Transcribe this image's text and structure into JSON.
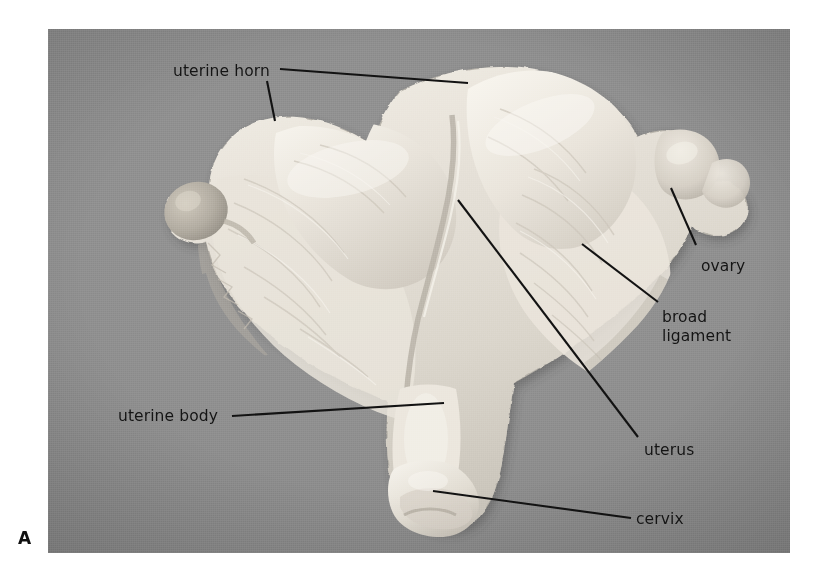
{
  "figure": {
    "panel_letter": "A",
    "background_color": "#8d8d8d",
    "label_color": "#141414",
    "leader_line_color": "#121212",
    "tissue_color": "#e3dfd6"
  },
  "annotations": [
    {
      "id": "uterine-horn",
      "label": "uterine horn",
      "text_x": 125,
      "text_y": 33,
      "leaders": [
        {
          "x1": 232,
          "y1": 40,
          "x2": 420,
          "y2": 54
        },
        {
          "x1": 219,
          "y1": 52,
          "x2": 227,
          "y2": 92
        }
      ]
    },
    {
      "id": "ovary",
      "label": "ovary",
      "text_x": 653,
      "text_y": 228,
      "leaders": [
        {
          "x1": 648,
          "y1": 216,
          "x2": 623,
          "y2": 159
        }
      ]
    },
    {
      "id": "broad-ligament",
      "label": "broad\nligament",
      "text_x": 614,
      "text_y": 279,
      "leaders": [
        {
          "x1": 610,
          "y1": 273,
          "x2": 534,
          "y2": 215
        }
      ]
    },
    {
      "id": "uterus",
      "label": "uterus",
      "text_x": 596,
      "text_y": 412,
      "leaders": [
        {
          "x1": 590,
          "y1": 408,
          "x2": 410,
          "y2": 171
        }
      ]
    },
    {
      "id": "uterine-body",
      "label": "uterine body",
      "text_x": 70,
      "text_y": 378,
      "leaders": [
        {
          "x1": 184,
          "y1": 387,
          "x2": 396,
          "y2": 374
        }
      ]
    },
    {
      "id": "cervix",
      "label": "cervix",
      "text_x": 588,
      "text_y": 481,
      "leaders": [
        {
          "x1": 583,
          "y1": 489,
          "x2": 385,
          "y2": 462
        }
      ]
    }
  ],
  "specimen": {
    "description": "bovine uterus, opened dorsal view",
    "parts": [
      "uterine horn",
      "ovary",
      "broad ligament",
      "uterus",
      "uterine body",
      "cervix"
    ]
  }
}
